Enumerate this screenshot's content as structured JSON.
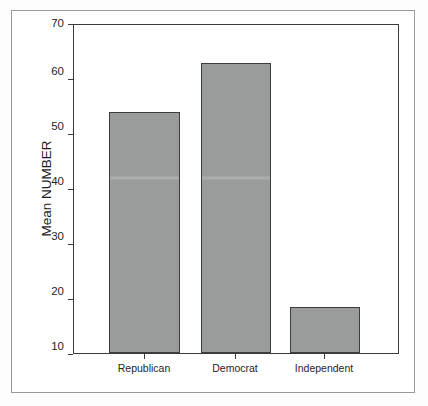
{
  "figure": {
    "background_color": "#ffffff",
    "frame_color": "#9a9a9a",
    "axis_color": "#3b3b3b",
    "bar_fill_color": "#9a9b9b",
    "bar_edge_color": "#3d3d3d"
  },
  "chart_data": {
    "type": "bar",
    "title": "",
    "xlabel": "",
    "ylabel": "Mean NUMBER",
    "categories": [
      "Republican",
      "Democrat",
      "Independent"
    ],
    "values": [
      54,
      63,
      18.5
    ],
    "ylim": [
      10,
      70
    ],
    "yticks": [
      10,
      20,
      30,
      40,
      50,
      60,
      70
    ],
    "ytick_labels": [
      "10",
      "20",
      "30",
      "40",
      "50",
      "60",
      "70"
    ],
    "grid": false,
    "legend": null,
    "series": [
      {
        "name": "Mean NUMBER",
        "values": [
          54,
          63,
          18.5
        ]
      }
    ],
    "annotations": []
  }
}
